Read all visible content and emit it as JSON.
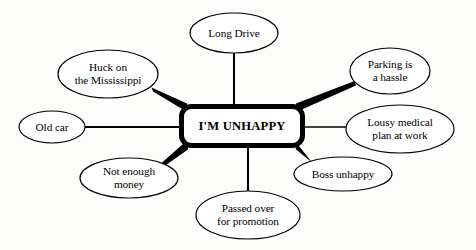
{
  "diagram": {
    "type": "mind-map",
    "title": "I'M UNHAPPY",
    "background_color": "#fdfdfb",
    "stroke_color": "#000000",
    "fill_color": "#ffffff",
    "center": {
      "label": "I'M UNHAPPY",
      "shape": "rounded-rectangle",
      "x": 241,
      "y": 126,
      "width": 124,
      "height": 42,
      "border_width": 5
    },
    "branches": [
      {
        "id": "long-drive",
        "label": "Long Drive",
        "shape": "ellipse",
        "cx": 234,
        "cy": 33,
        "rx": 44,
        "ry": 20,
        "connector": "thin",
        "direction": "top"
      },
      {
        "id": "huck-mississippi",
        "label": "Huck on\nthe Mississippi",
        "shape": "ellipse",
        "cx": 108,
        "cy": 74,
        "rx": 50,
        "ry": 24,
        "connector": "thick",
        "direction": "top-left"
      },
      {
        "id": "old-car",
        "label": "Old car",
        "shape": "ellipse",
        "cx": 52,
        "cy": 127,
        "rx": 33,
        "ry": 16,
        "connector": "thin",
        "direction": "left"
      },
      {
        "id": "not-enough-money",
        "label": "Not enough\nmoney",
        "shape": "ellipse",
        "cx": 129,
        "cy": 178,
        "rx": 49,
        "ry": 20,
        "connector": "thick",
        "direction": "bottom-left"
      },
      {
        "id": "passed-over",
        "label": "Passed over\nfor promotion",
        "shape": "ellipse",
        "cx": 248,
        "cy": 215,
        "rx": 52,
        "ry": 24,
        "connector": "thin",
        "direction": "bottom"
      },
      {
        "id": "boss-unhappy",
        "label": "Boss unhappy",
        "shape": "ellipse",
        "cx": 343,
        "cy": 174,
        "rx": 49,
        "ry": 17,
        "connector": "thick",
        "direction": "bottom-right"
      },
      {
        "id": "lousy-medical-plan",
        "label": "Lousy medical\nplan at work",
        "shape": "ellipse",
        "cx": 400,
        "cy": 129,
        "rx": 54,
        "ry": 24,
        "connector": "thin",
        "direction": "right"
      },
      {
        "id": "parking-hassle",
        "label": "Parking is\na hassle",
        "shape": "ellipse",
        "cx": 390,
        "cy": 71,
        "rx": 40,
        "ry": 23,
        "connector": "thick",
        "direction": "top-right"
      }
    ],
    "connectors": [
      {
        "id": "connector-long-drive",
        "from": "center",
        "to": "long-drive",
        "style": "thin",
        "x1": 234,
        "y1": 105,
        "x2": 234,
        "y2": 53
      },
      {
        "id": "connector-huck-mississippi",
        "from": "center",
        "to": "huck-mississippi",
        "style": "thick",
        "x1": 186,
        "y1": 108,
        "x2": 152,
        "y2": 89
      },
      {
        "id": "connector-old-car",
        "from": "center",
        "to": "old-car",
        "style": "thin",
        "x1": 180,
        "y1": 127,
        "x2": 85,
        "y2": 127
      },
      {
        "id": "connector-not-enough-money",
        "from": "center",
        "to": "not-enough-money",
        "style": "thick",
        "x1": 186,
        "y1": 145,
        "x2": 163,
        "y2": 164
      },
      {
        "id": "connector-passed-over",
        "from": "center",
        "to": "passed-over",
        "style": "thin",
        "x1": 248,
        "y1": 147,
        "x2": 248,
        "y2": 191
      },
      {
        "id": "connector-boss-unhappy",
        "from": "center",
        "to": "boss-unhappy",
        "style": "thick",
        "x1": 297,
        "y1": 145,
        "x2": 312,
        "y2": 162
      },
      {
        "id": "connector-lousy-medical-plan",
        "from": "center",
        "to": "lousy-medical-plan",
        "style": "thin",
        "x1": 303,
        "y1": 127,
        "x2": 347,
        "y2": 127
      },
      {
        "id": "connector-parking-hassle",
        "from": "center",
        "to": "parking-hassle",
        "style": "thick",
        "x1": 297,
        "y1": 108,
        "x2": 355,
        "y2": 83
      }
    ]
  }
}
